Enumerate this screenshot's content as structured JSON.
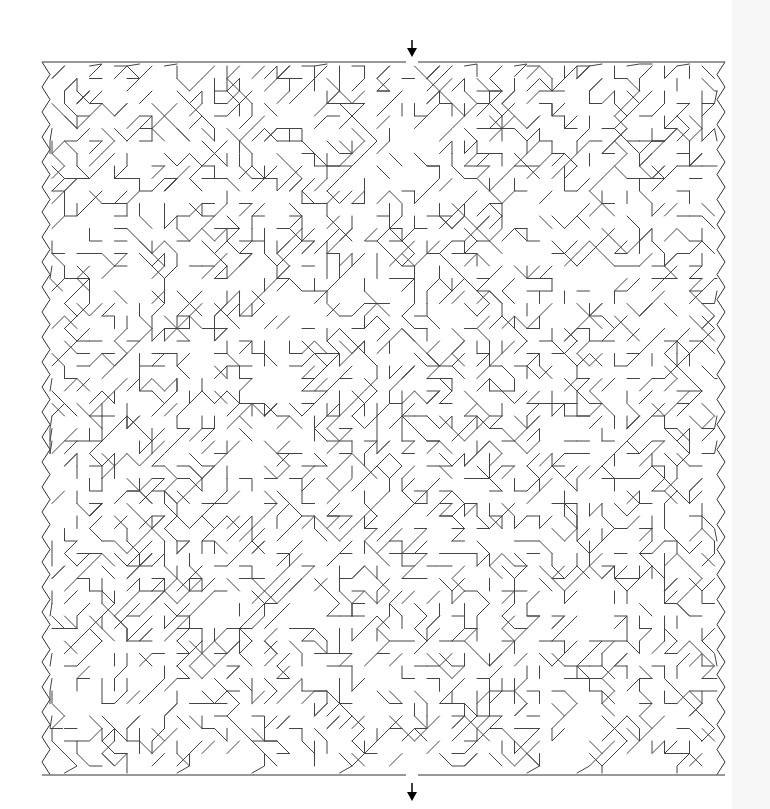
{
  "puzzle": {
    "type": "maze",
    "style": "sigma / irregular diagonal-orthogonal passages",
    "entrance": {
      "position": "top",
      "x": 412,
      "marker": "arrow-down"
    },
    "exit": {
      "position": "bottom",
      "x": 412,
      "marker": "arrow-down"
    },
    "bounds": {
      "left": 42,
      "top": 62,
      "right": 725,
      "bottom": 775
    },
    "colors": {
      "line": "#333333",
      "background": "#ffffff",
      "arrow": "#000000",
      "side_strip": "#f7f7f7"
    }
  }
}
